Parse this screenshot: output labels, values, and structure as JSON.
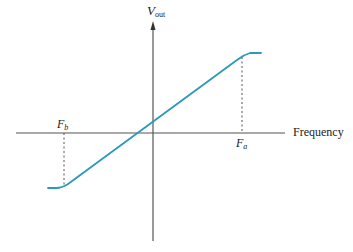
{
  "diagram": {
    "y_axis_label": {
      "main": "V",
      "sub": "out"
    },
    "x_axis_label": "Frequency",
    "marker_right": {
      "main": "F",
      "sub": "a"
    },
    "marker_left": {
      "main": "F",
      "sub": "b"
    },
    "colors": {
      "curve": "#2b9ab8",
      "axis": "#555555",
      "dashed": "#555555"
    }
  }
}
